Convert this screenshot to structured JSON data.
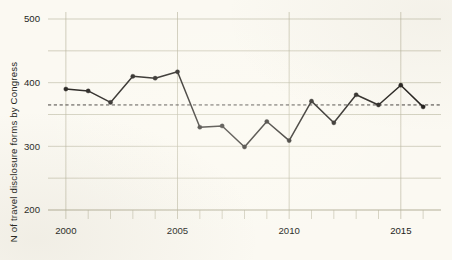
{
  "chart_data": {
    "type": "line",
    "title": "",
    "xlabel": "",
    "ylabel": "N of travel disclosure forms by Congress",
    "x": [
      2000,
      2001,
      2002,
      2003,
      2004,
      2005,
      2006,
      2007,
      2008,
      2009,
      2010,
      2011,
      2012,
      2013,
      2014,
      2015,
      2016
    ],
    "values": [
      390,
      387,
      369,
      410,
      407,
      417,
      330,
      332,
      299,
      339,
      309,
      371,
      337,
      381,
      365,
      396,
      362
    ],
    "series": [
      {
        "name": "N of travel disclosure forms by Congress",
        "values": [
          390,
          387,
          369,
          410,
          407,
          417,
          330,
          332,
          299,
          339,
          309,
          371,
          337,
          381,
          365,
          396,
          362
        ]
      }
    ],
    "xlim": [
      1999.2,
      2016.8
    ],
    "ylim": [
      190,
      510
    ],
    "xticks": [
      2000,
      2005,
      2010,
      2015
    ],
    "xtick_labels": [
      "2000",
      "2005",
      "2010",
      "2015"
    ],
    "xticks_minor": [
      2001,
      2002,
      2003,
      2004,
      2006,
      2007,
      2008,
      2009,
      2011,
      2012,
      2013,
      2014,
      2016
    ],
    "yticks": [
      200,
      300,
      400,
      500
    ],
    "ytick_labels": [
      "200",
      "300",
      "400",
      "500"
    ],
    "yticks_minor": [
      250,
      350,
      450
    ],
    "grid": true,
    "legend": "none",
    "annotations": [
      {
        "type": "hline",
        "label": "mean reference line",
        "value": 365,
        "style": "dashed"
      }
    ],
    "colors": {
      "line": "#1d1a17",
      "marker": "#1d1a17",
      "grid": "#b8b49e",
      "reference_line": "#3a3632",
      "axis_text": "#231f1c",
      "background": "#fbf9f2"
    }
  }
}
